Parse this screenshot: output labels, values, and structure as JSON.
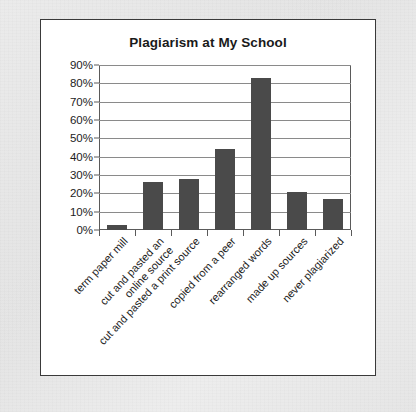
{
  "figure": {
    "background_color": "#e9e9e9",
    "panel_color": "#ffffff",
    "border_color": "#3a3a3a"
  },
  "chart_data": {
    "type": "bar",
    "title": "Plagiarism at My School",
    "xlabel": "",
    "ylabel": "",
    "ylim": [
      0,
      90
    ],
    "grid": true,
    "legend": null,
    "bar_color": "#4a4a4a",
    "ytick_labels": [
      "0%",
      "10%",
      "20%",
      "30%",
      "40%",
      "50%",
      "60%",
      "70%",
      "80%",
      "90%"
    ],
    "ytick_values": [
      0,
      10,
      20,
      30,
      40,
      50,
      60,
      70,
      80,
      90
    ],
    "categories": [
      "term paper mill",
      "cut and pasted an online source",
      "cut and pasted a print source",
      "copied from a peer",
      "rearranged words",
      "made up sources",
      "never plagiarized"
    ],
    "category_lines": [
      [
        "term paper mill"
      ],
      [
        "cut and pasted an",
        "online source"
      ],
      [
        "cut and pasted a print source"
      ],
      [
        "copied from a peer"
      ],
      [
        "rearranged words"
      ],
      [
        "made up sources"
      ],
      [
        "never plagiarized"
      ]
    ],
    "values": [
      3,
      26,
      28,
      44,
      83,
      21,
      17
    ],
    "value_labels": [
      "3%",
      "26%",
      "28%",
      "44%",
      "83%",
      "21%",
      "17%"
    ]
  }
}
